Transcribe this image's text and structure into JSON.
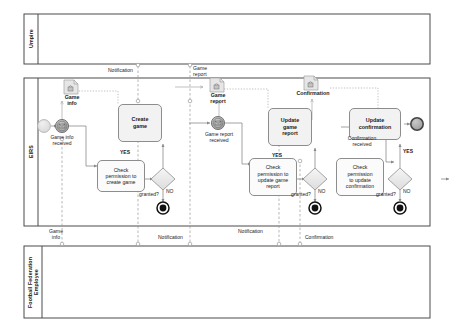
{
  "diagram": {
    "type": "bpmn-collaboration",
    "title": "",
    "colors": {
      "pool_border": "#4a4a4a",
      "lane_border": "#6e6e6e",
      "task_fill": "#f2f2f2",
      "task_border": "#8d8d8d",
      "event_gray": "#9d9d9d",
      "event_light": "#e2e2e2",
      "gateway_fill": "#ebebeb",
      "flow": "#8a8a8a",
      "message_flow": "#9a9a9a",
      "text": "#1a1a1a",
      "end_black": "#111111"
    }
  },
  "pools": [
    {
      "id": "umpire",
      "label": "Umpire"
    },
    {
      "id": "eirs",
      "label": "EIRS"
    },
    {
      "id": "ffe",
      "label": "Football Federation\nEmployee"
    }
  ],
  "data_objects": [
    {
      "id": "game-info",
      "label": "Game\ninfo",
      "icon": "lock-icon"
    },
    {
      "id": "game-report",
      "label": "Game\nreport",
      "icon": "lock-icon"
    },
    {
      "id": "confirmation",
      "label": "Confirmation",
      "icon": "lock-icon"
    }
  ],
  "events": [
    {
      "id": "start",
      "label": "",
      "kind": "start"
    },
    {
      "id": "game-info-received",
      "label": "Game info\nreceived",
      "kind": "intermediate-message"
    },
    {
      "id": "game-report-received",
      "label": "Game report\nreceived",
      "kind": "intermediate-message"
    },
    {
      "id": "confirmation-received",
      "label": "Confirmation\nreceived",
      "kind": "intermediate-message"
    },
    {
      "id": "end-create",
      "label": "",
      "kind": "end-terminate"
    },
    {
      "id": "end-update-report",
      "label": "",
      "kind": "end-terminate"
    },
    {
      "id": "end-update-confirmation",
      "label": "",
      "kind": "end-terminate"
    },
    {
      "id": "end-final",
      "label": "",
      "kind": "end"
    }
  ],
  "tasks": [
    {
      "id": "create-game",
      "label": "Create\ngame",
      "style": "bold"
    },
    {
      "id": "update-game-report",
      "label": "Update\ngame\nreport",
      "style": "bold"
    },
    {
      "id": "update-confirmation",
      "label": "Update\nconfirmation",
      "style": "bold"
    },
    {
      "id": "check-permission-create-game",
      "label": "Check\npermission to\ncreate game",
      "style": "plain"
    },
    {
      "id": "check-permission-update-game-report",
      "label": "Check\npermission to\nupdate game\nreport",
      "style": "plain"
    },
    {
      "id": "check-permission-update-confirmation",
      "label": "Check\npermission\nto update\nconfirmation",
      "style": "plain"
    }
  ],
  "gateways": [
    {
      "id": "granted-1",
      "label": "granted?",
      "yes": "YES",
      "no": "NO"
    },
    {
      "id": "granted-2",
      "label": "granted?",
      "yes": "YES",
      "no": "NO"
    },
    {
      "id": "granted-3",
      "label": "granted?",
      "yes": "YES",
      "no": "NO"
    }
  ],
  "message_flows": [
    {
      "id": "mf-top-notification",
      "label": "Notification"
    },
    {
      "id": "mf-top-game-report",
      "label": "Game\nreport"
    },
    {
      "id": "mf-bottom-game-info",
      "label": "Game\ninfo"
    },
    {
      "id": "mf-bottom-notification-1",
      "label": "Notification"
    },
    {
      "id": "mf-bottom-notification-2",
      "label": "Notification"
    },
    {
      "id": "mf-bottom-confirmation",
      "label": "Confirmation"
    }
  ]
}
